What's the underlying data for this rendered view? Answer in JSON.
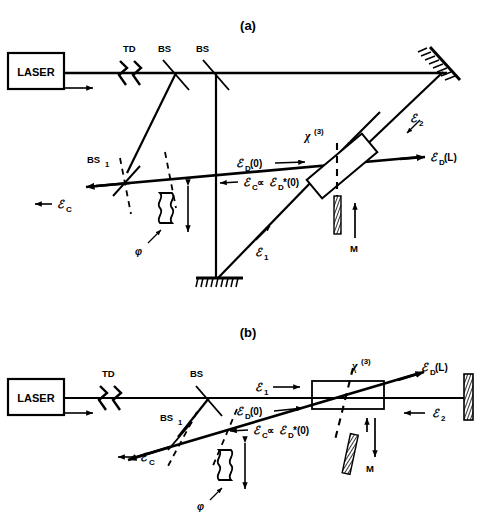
{
  "figure": {
    "top_partial_text": "",
    "panels": [
      {
        "caption": "(a)",
        "source_label": "LASER",
        "components": {
          "td": "TD",
          "bs_upper_1": "BS",
          "bs_upper_2": "BS",
          "bs_lower": "BS",
          "bs_lower_sub": "1",
          "chi": "χ",
          "chi_sup": "(3)",
          "mirror_m": "M",
          "phase_plate": "φ"
        },
        "beams": {
          "e1": "ℰ",
          "e1_sub": "1",
          "e2": "ℰ",
          "e2_sub": "2",
          "ec": "ℰ",
          "ec_sub": "C",
          "ed0": "ℰ",
          "ed0_sub": "D",
          "ed0_arg": "(0)",
          "edL": "ℰ",
          "edL_sub": "D",
          "edL_arg": "(L)",
          "conj_relation_1": "ℰ",
          "conj_relation_1_sub": "C",
          "conj_relation_op": "∝",
          "conj_relation_2": "ℰ",
          "conj_relation_2_sub": "D",
          "conj_relation_2_arg": "*(0)"
        }
      },
      {
        "caption": "(b)",
        "source_label": "LASER",
        "components": {
          "td": "TD",
          "bs_upper_1": "BS",
          "bs_lower": "BS",
          "bs_lower_sub": "1",
          "chi": "χ",
          "chi_sup": "(3)",
          "mirror_m": "M",
          "phase_plate": "φ"
        },
        "beams": {
          "e1": "ℰ",
          "e1_sub": "1",
          "e2": "ℰ",
          "e2_sub": "2",
          "ec": "ℰ",
          "ec_sub": "C",
          "ed0": "ℰ",
          "ed0_sub": "D",
          "ed0_arg": "(0)",
          "edL": "ℰ",
          "edL_sub": "D",
          "edL_arg": "(L)",
          "conj_relation_1": "ℰ",
          "conj_relation_1_sub": "C",
          "conj_relation_op": "∝",
          "conj_relation_2": "ℰ",
          "conj_relation_2_sub": "D",
          "conj_relation_2_arg": "*(0)"
        }
      }
    ],
    "colors": {
      "ink": "#000000",
      "background": "#ffffff",
      "hatch": "#1a1a1a"
    }
  }
}
